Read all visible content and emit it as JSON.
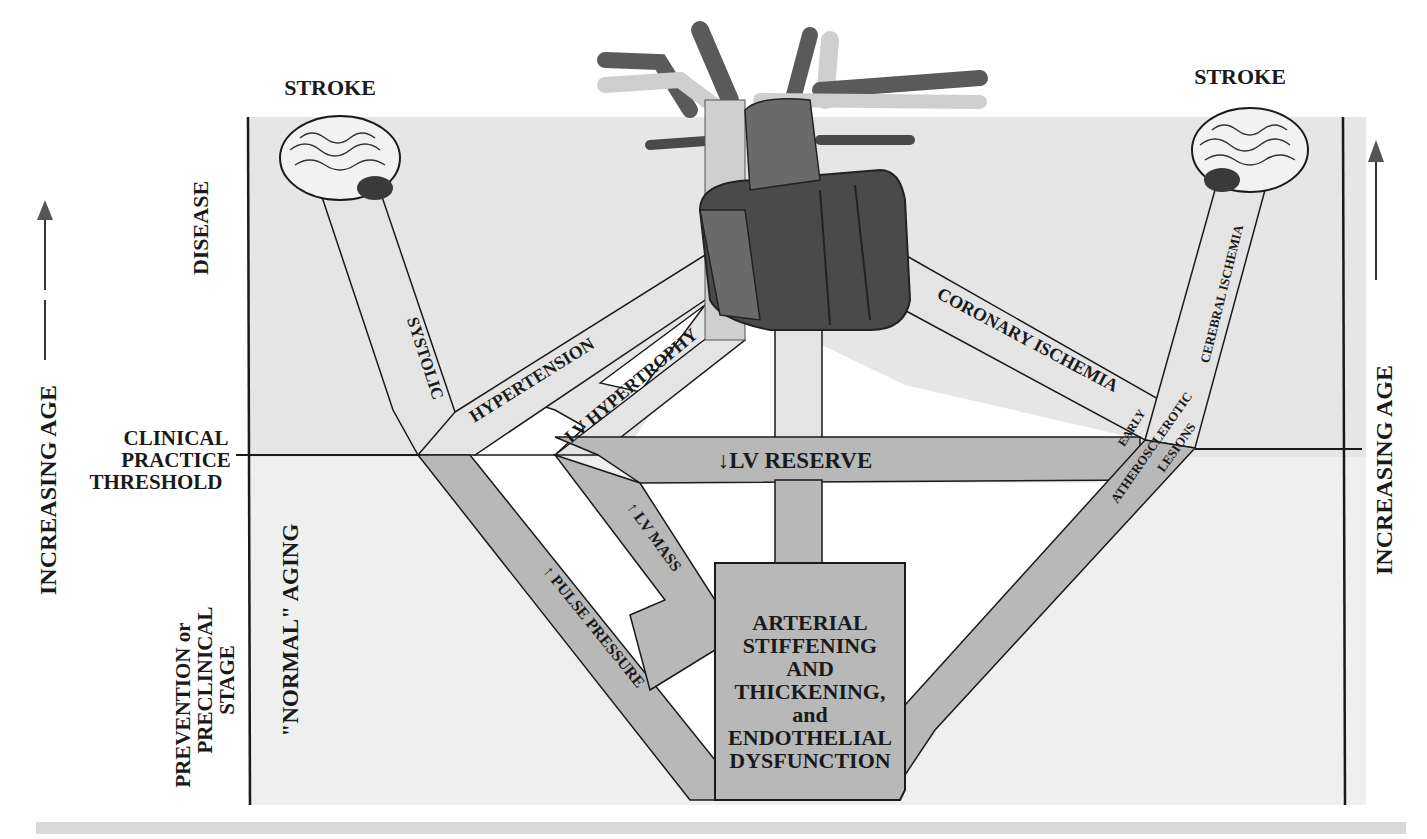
{
  "diagram": {
    "title_left": "STROKE",
    "title_right": "STROKE",
    "left_axis": {
      "label": "INCREASING AGE",
      "arrow": "up-arrow"
    },
    "right_axis": {
      "label": "INCREASING AGE",
      "arrow": "up-arrow"
    },
    "zones": {
      "disease": "DISEASE",
      "threshold_lines": [
        "CLINICAL",
        "PRACTICE",
        "THRESHOLD"
      ],
      "prevention_lines": [
        "PREVENTION or",
        "PRECLINICAL",
        "STAGE"
      ],
      "normal_aging": "\"NORMAL\" AGING"
    },
    "pathways": {
      "systolic": "SYSTOLIC",
      "hypertension": "HYPERTENSION",
      "lv_hypertrophy": "LV HYPERTROPHY",
      "lv_reserve": "↓LV RESERVE",
      "lv_mass": "↑ LV MASS",
      "pulse_pressure": "↑ PULSE PRESSURE",
      "coronary_ischemia": "CORONARY ISCHEMIA",
      "cerebral_ischemia": "CEREBRAL ISCHEMIA",
      "early": "EARLY",
      "atherosclerotic": "ATHEROSCLEROTIC",
      "lesions": "LESIONS",
      "vascular_cell_changes": "VASCULAR CELL CHANGES"
    },
    "center_box_lines": [
      "ARTERIAL",
      "STIFFENING",
      "AND",
      "THICKENING,",
      "and",
      "ENDOTHELIAL",
      "DYSFUNCTION"
    ],
    "images": {
      "left_brain": "brain-icon",
      "right_brain": "brain-icon",
      "heart": "heart-icon"
    },
    "colors": {
      "disease_zone": "#e6e6e6",
      "preclinical_zone": "#efefef",
      "pathway_light": "#e4e4e4",
      "pathway_dark": "#b8b8b8",
      "heart_dark": "#4a4a4a",
      "heart_mid": "#6a6a6a",
      "vessel_light": "#cfcfcf",
      "line": "#1a1a1a"
    }
  }
}
